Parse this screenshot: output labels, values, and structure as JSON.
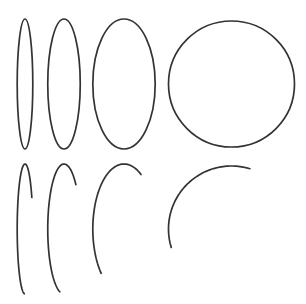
{
  "diagram": {
    "stroke_color": "#333333",
    "background_color": "#ffffff",
    "rows": [
      {
        "name": "full-shapes",
        "shapes": [
          {
            "kind": "ellipse",
            "aspect_ratio": 0.12,
            "arc_fraction": 1.0
          },
          {
            "kind": "ellipse",
            "aspect_ratio": 0.25,
            "arc_fraction": 1.0
          },
          {
            "kind": "ellipse",
            "aspect_ratio": 0.48,
            "arc_fraction": 1.0
          },
          {
            "kind": "circle",
            "aspect_ratio": 1.0,
            "arc_fraction": 1.0
          }
        ]
      },
      {
        "name": "partial-arcs",
        "shapes": [
          {
            "kind": "ellipse-arc",
            "aspect_ratio": 0.12,
            "start_angle_deg": -29,
            "sweep_deg": -236
          },
          {
            "kind": "ellipse-arc",
            "aspect_ratio": 0.25,
            "start_angle_deg": -43,
            "sweep_deg": -212
          },
          {
            "kind": "ellipse-arc",
            "aspect_ratio": 0.48,
            "start_angle_deg": -57,
            "sweep_deg": -166
          },
          {
            "kind": "circle-arc",
            "aspect_ratio": 1.0,
            "start_angle_deg": -73,
            "sweep_deg": -124
          }
        ]
      }
    ]
  }
}
